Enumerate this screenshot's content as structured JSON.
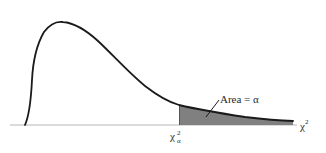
{
  "diagram": {
    "type": "chi-square-distribution",
    "colors": {
      "curve": "#1a1a1a",
      "axis": "#b8b8b8",
      "shaded_area": "#808080",
      "text": "#2a2a2a"
    }
  },
  "labels": {
    "area": "Area = α",
    "x_axis_symbol": "χ",
    "x_axis_superscript": "2",
    "critical_value_symbol": "χ",
    "critical_value_superscript": "2",
    "critical_value_subscript": "α"
  }
}
